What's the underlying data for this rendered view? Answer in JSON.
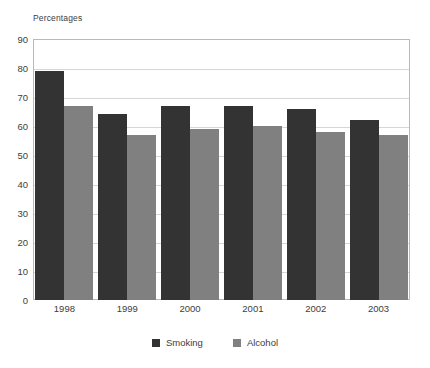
{
  "chart_data": {
    "type": "bar",
    "title": "",
    "subtitle": "",
    "ylabel": "Percentages",
    "xlabel": "",
    "categories": [
      "1998",
      "1999",
      "2000",
      "2001",
      "2002",
      "2003"
    ],
    "series": [
      {
        "name": "Smoking",
        "color": "#333333",
        "values": [
          79,
          64,
          67,
          67,
          66,
          62
        ]
      },
      {
        "name": "Alcohol",
        "color": "#808080",
        "values": [
          67,
          57,
          59,
          60,
          58,
          57
        ]
      }
    ],
    "ylim": [
      0,
      90
    ],
    "yticks": [
      0,
      10,
      20,
      30,
      40,
      50,
      60,
      70,
      80,
      90
    ],
    "ytick_labels": [
      "0",
      "10",
      "20",
      "30",
      "40",
      "50",
      "60",
      "70",
      "80",
      "90"
    ],
    "grid": true,
    "grid_axis": "y",
    "legend_position": "bottom",
    "legend_entries": [
      "Smoking",
      "Alcohol"
    ]
  }
}
